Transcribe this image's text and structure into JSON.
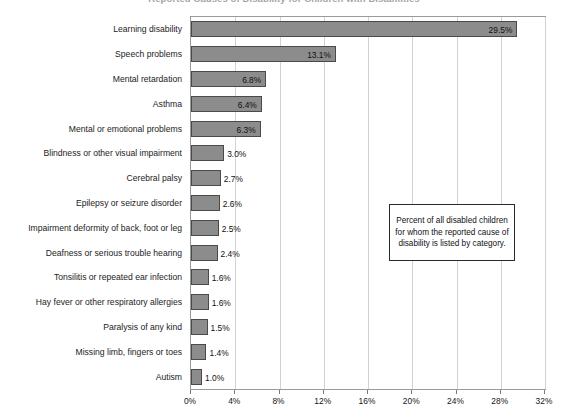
{
  "chart_data": {
    "type": "bar",
    "orientation": "horizontal",
    "title": "Reported Causes of Disability for Children with Disabilities",
    "xlabel": "",
    "ylabel": "",
    "xlim": [
      0,
      32
    ],
    "grid": true,
    "legend": false,
    "annotation": "Percent of all disabled children for whom the reported cause of disability is listed by category.",
    "categories": [
      "Learning disability",
      "Speech problems",
      "Mental retardation",
      "Asthma",
      "Mental or emotional problems",
      "Blindness or other visual impairment",
      "Cerebral palsy",
      "Epilepsy or seizure disorder",
      "Impairment deformity of back, foot or leg",
      "Deafness or serious trouble hearing",
      "Tonsilitis or repeated ear infection",
      "Hay fever or other respiratory allergies",
      "Paralysis of any kind",
      "Missing limb, fingers or toes",
      "Autism"
    ],
    "values": [
      29.5,
      13.1,
      6.8,
      6.4,
      6.3,
      3.0,
      2.7,
      2.6,
      2.5,
      2.4,
      1.6,
      1.6,
      1.5,
      1.4,
      1.0
    ],
    "value_labels": [
      "29.5%",
      "13.1%",
      "6.8%",
      "6.4%",
      "6.3%",
      "3.0%",
      "2.7%",
      "2.6%",
      "2.5%",
      "2.4%",
      "1.6%",
      "1.6%",
      "1.5%",
      "1.4%",
      "1.0%"
    ],
    "xticks": [
      0,
      4,
      8,
      12,
      16,
      20,
      24,
      28,
      32
    ],
    "xtick_labels": [
      "0%",
      "4%",
      "8%",
      "12%",
      "16%",
      "20%",
      "24%",
      "28%",
      "32%"
    ],
    "colors": {
      "bar_fill": "#8c8c8c",
      "bar_border": "#4a4a4a",
      "gridline": "#d2d2d2",
      "plot_border": "#9a9a9a",
      "text": "#111111",
      "background": "#ffffff"
    }
  }
}
